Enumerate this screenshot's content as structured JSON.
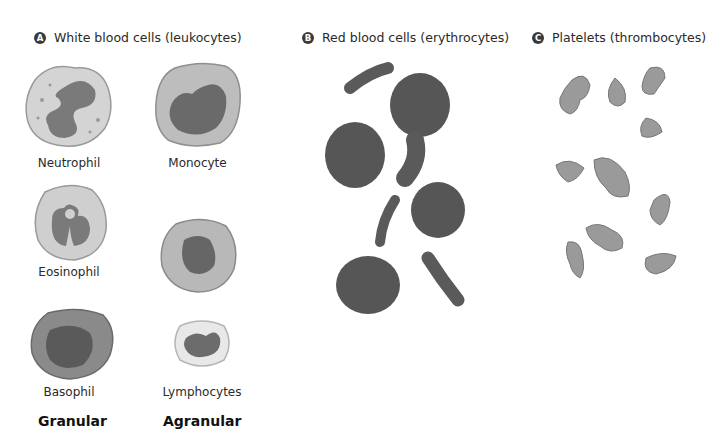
{
  "sections": {
    "a": {
      "badge": "A",
      "title": "White blood cells (leukocytes)"
    },
    "b": {
      "badge": "B",
      "title": "Red blood cells (erythrocytes)"
    },
    "c": {
      "badge": "C",
      "title": "Platelets (thrombocytes)"
    }
  },
  "wbc": {
    "neutrophil": "Neutrophil",
    "monocyte": "Monocyte",
    "eosinophil": "Eosinophil",
    "basophil": "Basophil",
    "lymphocytes": "Lymphocytes"
  },
  "groups": {
    "granular": "Granular",
    "agranular": "Agranular"
  },
  "colors": {
    "cell_light": "#c9c9c9",
    "nucleus": "#6e6e6e",
    "rbc": "#555555",
    "platelet": "#9a9a9a"
  }
}
